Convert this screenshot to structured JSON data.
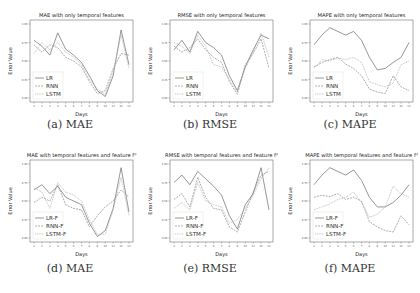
{
  "figure": {
    "captions": [
      "(a) MAE",
      "(b) RMSE",
      "(c) MAPE",
      "(d) MAE",
      "(e) RMSE",
      "(f) MAPE"
    ]
  },
  "chart_data": [
    {
      "type": "line",
      "title": "MAE with only temporal features",
      "xlabel": "Days",
      "ylabel": "Error Value",
      "x": [
        1,
        2,
        3,
        4,
        5,
        6,
        7,
        8,
        9,
        10,
        11,
        12,
        13
      ],
      "ylim": [
        0,
        1
      ],
      "legend": "lower-left",
      "series": [
        {
          "name": "LR",
          "values": [
            0.78,
            0.7,
            0.58,
            0.88,
            0.66,
            0.58,
            0.48,
            0.3,
            0.1,
            0.02,
            0.3,
            0.92,
            0.45
          ]
        },
        {
          "name": "RNN",
          "values": [
            0.72,
            0.62,
            0.72,
            0.68,
            0.55,
            0.5,
            0.42,
            0.22,
            0.06,
            0.1,
            0.4,
            0.6,
            0.58
          ]
        },
        {
          "name": "LSTM",
          "values": [
            0.6,
            0.75,
            0.65,
            0.75,
            0.62,
            0.55,
            0.45,
            0.25,
            0.12,
            0.05,
            0.35,
            0.85,
            0.4
          ]
        }
      ]
    },
    {
      "type": "line",
      "title": "RMSE with only temporal features",
      "xlabel": "Days",
      "ylabel": "Error Value",
      "x": [
        1,
        2,
        3,
        4,
        5,
        6,
        7,
        8,
        9,
        10,
        11,
        12,
        13
      ],
      "ylim": [
        0,
        1
      ],
      "legend": "lower-left",
      "series": [
        {
          "name": "LR",
          "values": [
            0.65,
            0.78,
            0.62,
            0.9,
            0.75,
            0.68,
            0.58,
            0.3,
            0.1,
            0.42,
            0.65,
            0.85,
            0.8
          ]
        },
        {
          "name": "RNN",
          "values": [
            0.7,
            0.62,
            0.68,
            0.8,
            0.65,
            0.55,
            0.48,
            0.22,
            0.05,
            0.45,
            0.6,
            0.8,
            0.4
          ]
        },
        {
          "name": "LSTM",
          "values": [
            0.75,
            0.7,
            0.6,
            0.85,
            0.7,
            0.45,
            0.42,
            0.25,
            0.08,
            0.4,
            0.62,
            0.88,
            0.55
          ]
        }
      ]
    },
    {
      "type": "line",
      "title": "MAPE with only temporal features",
      "xlabel": "Days",
      "ylabel": "Error Value",
      "x": [
        1,
        2,
        3,
        4,
        5,
        6,
        7,
        8,
        9,
        10,
        11,
        12,
        13
      ],
      "ylim": [
        0,
        1
      ],
      "legend": "lower-left",
      "series": [
        {
          "name": "LR",
          "values": [
            0.72,
            0.85,
            0.95,
            0.9,
            0.85,
            0.9,
            0.78,
            0.55,
            0.38,
            0.4,
            0.48,
            0.55,
            0.75
          ]
        },
        {
          "name": "RNN",
          "values": [
            0.42,
            0.48,
            0.52,
            0.55,
            0.46,
            0.4,
            0.3,
            0.12,
            0.08,
            0.06,
            0.3,
            0.15,
            0.1
          ]
        },
        {
          "name": "LSTM",
          "values": [
            0.4,
            0.52,
            0.5,
            0.54,
            0.52,
            0.55,
            0.48,
            0.22,
            0.18,
            0.15,
            0.2,
            0.45,
            0.5
          ]
        }
      ]
    },
    {
      "type": "line",
      "title": "MAE with temporal features and feature f_d",
      "xlabel": "Days",
      "ylabel": "Error Value",
      "x": [
        1,
        2,
        3,
        4,
        5,
        6,
        7,
        8,
        9,
        10,
        11,
        12,
        13
      ],
      "ylim": [
        0,
        1
      ],
      "legend": "lower-left",
      "series": [
        {
          "name": "LR-F",
          "values": [
            0.65,
            0.72,
            0.6,
            0.7,
            0.55,
            0.5,
            0.45,
            0.2,
            0.02,
            0.1,
            0.4,
            0.95,
            0.35
          ]
        },
        {
          "name": "RNN-F",
          "values": [
            0.48,
            0.55,
            0.5,
            0.72,
            0.45,
            0.4,
            0.38,
            0.15,
            0.3,
            0.42,
            0.5,
            0.65,
            0.55
          ]
        },
        {
          "name": "LSTM-F",
          "values": [
            0.68,
            0.62,
            0.4,
            0.75,
            0.62,
            0.58,
            0.5,
            0.25,
            0.05,
            0.05,
            0.38,
            0.82,
            0.3
          ]
        }
      ]
    },
    {
      "type": "line",
      "title": "RMSE with temporal features and feature f_d",
      "xlabel": "Days",
      "ylabel": "Error Value",
      "x": [
        1,
        2,
        3,
        4,
        5,
        6,
        7,
        8,
        9,
        10,
        11,
        12,
        13
      ],
      "ylim": [
        0,
        1
      ],
      "legend": "lower-left",
      "series": [
        {
          "name": "LR-F",
          "values": [
            0.75,
            0.85,
            0.72,
            0.9,
            0.8,
            0.7,
            0.58,
            0.3,
            0.12,
            0.45,
            0.6,
            0.95,
            0.38
          ]
        },
        {
          "name": "RNN-F",
          "values": [
            0.52,
            0.6,
            0.42,
            0.82,
            0.55,
            0.4,
            0.38,
            0.15,
            0.08,
            0.35,
            0.62,
            0.85,
            0.9
          ]
        },
        {
          "name": "LSTM-F",
          "values": [
            0.4,
            0.48,
            0.38,
            0.75,
            0.5,
            0.45,
            0.42,
            0.2,
            0.25,
            0.4,
            0.58,
            0.8,
            0.95
          ]
        }
      ]
    },
    {
      "type": "line",
      "title": "MAPE with temporal features and feature f_d",
      "xlabel": "Days",
      "ylabel": "Error Value",
      "x": [
        1,
        2,
        3,
        4,
        5,
        6,
        7,
        8,
        9,
        10,
        11,
        12,
        13
      ],
      "ylim": [
        0,
        1
      ],
      "legend": "lower-left",
      "series": [
        {
          "name": "LR-F",
          "values": [
            0.72,
            0.85,
            0.95,
            0.9,
            0.85,
            0.92,
            0.78,
            0.55,
            0.42,
            0.42,
            0.48,
            0.58,
            0.72
          ]
        },
        {
          "name": "RNN-F",
          "values": [
            0.55,
            0.58,
            0.56,
            0.6,
            0.52,
            0.55,
            0.5,
            0.22,
            0.15,
            0.1,
            0.08,
            0.3,
            0.18
          ]
        },
        {
          "name": "LSTM-F",
          "values": [
            0.38,
            0.42,
            0.46,
            0.52,
            0.55,
            0.62,
            0.48,
            0.28,
            0.32,
            0.42,
            0.7,
            0.6,
            0.55
          ]
        }
      ]
    }
  ]
}
